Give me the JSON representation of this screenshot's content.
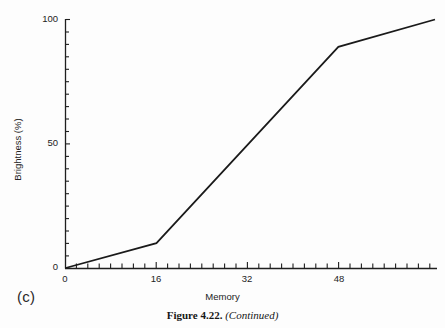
{
  "figure": {
    "panel_letter": "(c)",
    "caption_bold": "Figure 4.22.",
    "caption_italic": "(Continued)"
  },
  "chart_data": {
    "type": "line",
    "title": "",
    "xlabel": "Memory",
    "ylabel": "Brightness (%)",
    "xlim": [
      0,
      65
    ],
    "ylim": [
      0,
      100
    ],
    "grid": false,
    "legend": null,
    "x_major_ticks": [
      0,
      16,
      32,
      48
    ],
    "x_major_tick_labels": [
      "0",
      "16",
      "32",
      "48"
    ],
    "x_minor_tick_step": 2,
    "y_major_ticks": [
      0,
      50,
      100
    ],
    "y_major_tick_labels": [
      "0",
      "50",
      "100"
    ],
    "y_minor_tick_step": 5,
    "series": [
      {
        "name": "brightness-vs-memory",
        "color": "#1a1a1a",
        "x": [
          0,
          16,
          48,
          65
        ],
        "values": [
          0,
          10,
          89,
          100
        ]
      }
    ]
  },
  "axis_labels": {
    "y": [
      "100",
      "50",
      "0"
    ],
    "x": [
      "0",
      "16",
      "32",
      "48"
    ]
  }
}
